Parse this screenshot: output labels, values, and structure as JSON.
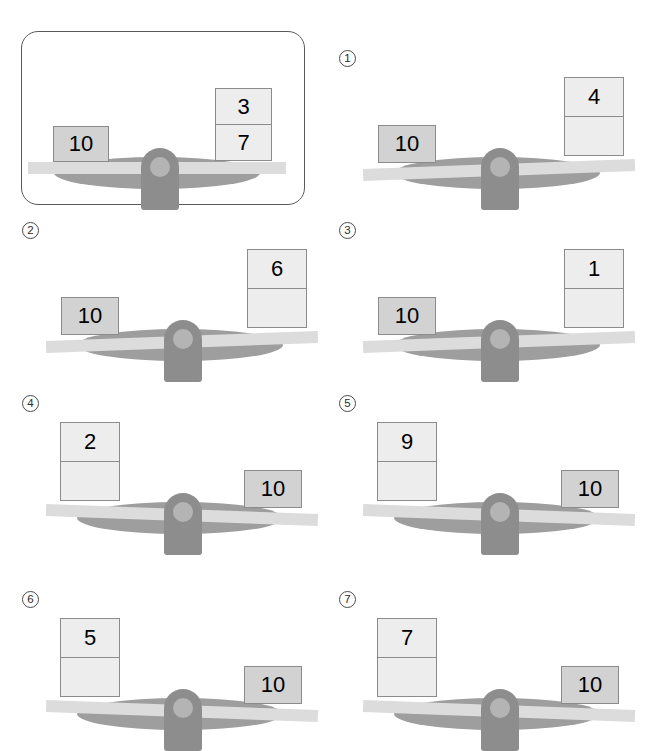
{
  "worksheet": {
    "type": "balance-scale-comparison",
    "block_label_known": "10",
    "example": {
      "index_label": "",
      "is_example": true,
      "left": {
        "kind": "single",
        "values": [
          "10"
        ]
      },
      "right": {
        "kind": "stack",
        "values": [
          "3",
          "7"
        ]
      },
      "beam_state": "level"
    },
    "problems": [
      {
        "index_label": "1",
        "left": {
          "kind": "single",
          "values": [
            "10"
          ]
        },
        "right": {
          "kind": "stack",
          "values": [
            "4",
            ""
          ]
        },
        "beam_state": "tilt-right-up"
      },
      {
        "index_label": "2",
        "left": {
          "kind": "single",
          "values": [
            "10"
          ]
        },
        "right": {
          "kind": "stack",
          "values": [
            "6",
            ""
          ]
        },
        "beam_state": "tilt-right-up"
      },
      {
        "index_label": "3",
        "left": {
          "kind": "single",
          "values": [
            "10"
          ]
        },
        "right": {
          "kind": "stack",
          "values": [
            "1",
            ""
          ]
        },
        "beam_state": "tilt-right-up"
      },
      {
        "index_label": "4",
        "left": {
          "kind": "stack",
          "values": [
            "2",
            ""
          ]
        },
        "right": {
          "kind": "single",
          "values": [
            "10"
          ]
        },
        "beam_state": "tilt-left-up"
      },
      {
        "index_label": "5",
        "left": {
          "kind": "stack",
          "values": [
            "9",
            ""
          ]
        },
        "right": {
          "kind": "single",
          "values": [
            "10"
          ]
        },
        "beam_state": "tilt-left-up"
      },
      {
        "index_label": "6",
        "left": {
          "kind": "stack",
          "values": [
            "5",
            ""
          ]
        },
        "right": {
          "kind": "single",
          "values": [
            "10"
          ]
        },
        "beam_state": "tilt-left-up"
      },
      {
        "index_label": "7",
        "left": {
          "kind": "stack",
          "values": [
            "7",
            ""
          ]
        },
        "right": {
          "kind": "single",
          "values": [
            "10"
          ]
        },
        "beam_state": "tilt-left-up"
      }
    ],
    "colors": {
      "solid_block": "#d2d2d2",
      "light_block": "#ededed",
      "block_border": "#8b8b8b",
      "beam": "#dcdcdc",
      "pivot": "#8d8d8d",
      "pivot_hole": "#b4b4b4",
      "shadow": "#9e9e9e",
      "frame_border": "#5a5a5a",
      "text": "#000000"
    }
  }
}
